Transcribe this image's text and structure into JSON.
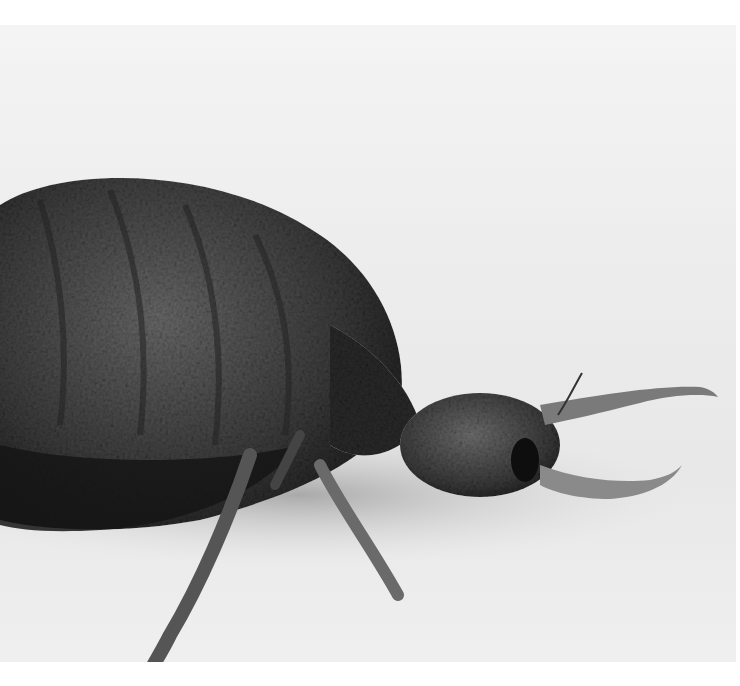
{
  "image": {
    "subject": "antlion larva",
    "alt": "Black and white close-up photograph of an antlion larva with fuzzy segmented body and long curved mandibles",
    "palette": {
      "background": "#ececec",
      "body_dark": "#2a2a2a",
      "body_mid": "#5a5a5a",
      "shadow": "#1a1a1a"
    }
  }
}
